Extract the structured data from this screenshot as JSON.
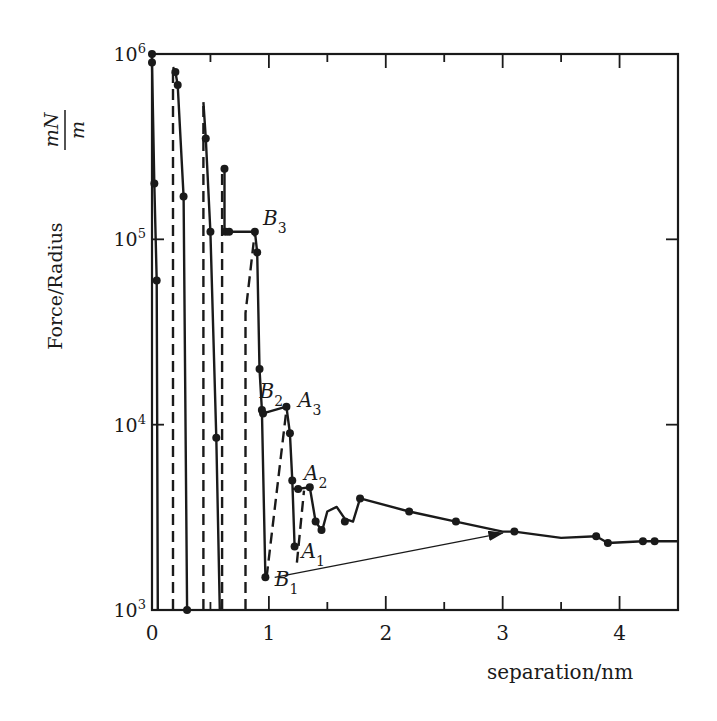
{
  "chart_data": {
    "type": "line",
    "title": "",
    "xlabel": "separation/nm",
    "ylabel": "Force/Radius",
    "ylabel_unit": {
      "numerator": "mN",
      "denominator": "m"
    },
    "yscale": "log",
    "xlim": [
      0,
      4.5
    ],
    "ylim": [
      1000,
      1000000
    ],
    "x_ticks": [
      "0",
      "1",
      "2",
      "3",
      "4"
    ],
    "y_ticks": [
      {
        "base": "10",
        "exp": "3",
        "value": 1000
      },
      {
        "base": "10",
        "exp": "4",
        "value": 10000
      },
      {
        "base": "10",
        "exp": "5",
        "value": 100000
      },
      {
        "base": "10",
        "exp": "6",
        "value": 1000000
      }
    ],
    "grid": false,
    "legend": null,
    "annotations": [
      {
        "text": "B",
        "sub": "3",
        "x": 0.95,
        "y": 120000
      },
      {
        "text": "B",
        "sub": "2",
        "x": 0.92,
        "y": 14000
      },
      {
        "text": "A",
        "sub": "3",
        "x": 1.25,
        "y": 12500
      },
      {
        "text": "A",
        "sub": "2",
        "x": 1.3,
        "y": 5000
      },
      {
        "text": "A",
        "sub": "1",
        "x": 1.28,
        "y": 1900
      },
      {
        "text": "B",
        "sub": "1",
        "x": 1.05,
        "y": 1350
      }
    ],
    "series": [
      {
        "name": "inward (solid)",
        "style": "solid",
        "x": [
          0.0,
          0.0,
          0.02,
          0.04,
          0.05
        ],
        "y": [
          1000000,
          900000,
          200000,
          60000,
          1000
        ]
      },
      {
        "name": "outward jump 1 (dashed)",
        "style": "dashed",
        "x": [
          0.18,
          0.18
        ],
        "y": [
          1000,
          850000
        ]
      },
      {
        "name": "inward 2 (solid)",
        "style": "solid",
        "x": [
          0.18,
          0.2,
          0.22,
          0.27,
          0.3
        ],
        "y": [
          850000,
          800000,
          680000,
          170000,
          1000
        ]
      },
      {
        "name": "outward jump 2 (dashed)",
        "style": "dashed",
        "x": [
          0.44,
          0.44
        ],
        "y": [
          1000,
          550000
        ]
      },
      {
        "name": "inward 3 (solid)",
        "style": "solid",
        "x": [
          0.44,
          0.46,
          0.5,
          0.55,
          0.58
        ],
        "y": [
          550000,
          350000,
          110000,
          8500,
          1000
        ]
      },
      {
        "name": "outward jump 3 (dashed)",
        "style": "dashed",
        "x": [
          0.6,
          0.6
        ],
        "y": [
          1000,
          240000
        ]
      },
      {
        "name": "inward 4 with B3 plateau (solid)",
        "style": "solid",
        "x": [
          0.62,
          0.62,
          0.88,
          0.9,
          0.92,
          0.94,
          0.97
        ],
        "y": [
          240000,
          110000,
          110000,
          85000,
          20000,
          12000,
          1500
        ]
      },
      {
        "name": "outward jump 4 (dashed)",
        "style": "dashed",
        "x": [
          0.8,
          0.8,
          0.88
        ],
        "y": [
          1000,
          40000,
          110000
        ]
      },
      {
        "name": "B2 plateau / A3 (solid)",
        "style": "solid",
        "x": [
          0.95,
          1.15,
          1.18,
          1.2,
          1.22
        ],
        "y": [
          11500,
          12500,
          9000,
          5000,
          2200
        ]
      },
      {
        "name": "A2 branch (solid)",
        "style": "solid",
        "x": [
          1.2,
          1.25,
          1.35,
          1.4,
          1.45
        ],
        "y": [
          4500,
          4500,
          4600,
          3000,
          2700
        ]
      },
      {
        "name": "jump to A3 (dashed)",
        "style": "dashed",
        "x": [
          0.98,
          1.15
        ],
        "y": [
          1500,
          12000
        ]
      },
      {
        "name": "jump to A2 (dashed)",
        "style": "dashed",
        "x": [
          1.24,
          1.3
        ],
        "y": [
          1800,
          4400
        ]
      },
      {
        "name": "oscillation tail (solid)",
        "style": "solid",
        "x": [
          1.45,
          1.5,
          1.58,
          1.65,
          1.72,
          1.78,
          2.2,
          2.6,
          3.0,
          3.1,
          3.5,
          3.8,
          3.9,
          4.2,
          4.3,
          4.5
        ],
        "y": [
          2600,
          3400,
          3600,
          3100,
          3000,
          4000,
          3400,
          3000,
          2650,
          2650,
          2450,
          2500,
          2300,
          2350,
          2350,
          2350
        ]
      },
      {
        "name": "B1 to far jump (arrow)",
        "style": "arrow",
        "x": [
          1.05,
          3.0
        ],
        "y": [
          1500,
          2600
        ]
      }
    ],
    "markers": {
      "x": [
        0.0,
        0.0,
        0.02,
        0.04,
        0.2,
        0.22,
        0.27,
        0.3,
        0.46,
        0.5,
        0.55,
        0.62,
        0.63,
        0.66,
        0.88,
        0.9,
        0.92,
        0.94,
        0.95,
        0.97,
        1.15,
        1.18,
        1.2,
        1.22,
        1.25,
        1.35,
        1.4,
        1.45,
        1.65,
        1.78,
        2.2,
        2.6,
        3.1,
        3.8,
        3.9,
        4.2,
        4.3
      ],
      "y": [
        1000000,
        900000,
        200000,
        60000,
        800000,
        680000,
        170000,
        1000,
        350000,
        110000,
        8500,
        240000,
        110000,
        110000,
        110000,
        85000,
        20000,
        12000,
        11500,
        1500,
        12500,
        9000,
        5000,
        2200,
        4500,
        4600,
        3000,
        2700,
        3000,
        4000,
        3400,
        3000,
        2650,
        2500,
        2300,
        2350,
        2350
      ]
    }
  },
  "figure": {
    "x_axis_label": "separation/nm",
    "y_axis_label": "Force/Radius",
    "y_unit_num": "mN",
    "y_unit_den": "m"
  }
}
